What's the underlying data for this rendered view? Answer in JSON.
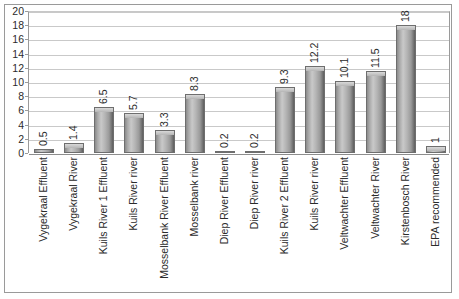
{
  "chart_data": {
    "type": "bar",
    "title": "",
    "subtitle": "",
    "xlabel": "",
    "ylabel": "",
    "ylim": [
      0,
      20
    ],
    "ytick_step": 2,
    "yticks": [
      20,
      18,
      16,
      14,
      12,
      10,
      8,
      6,
      4,
      2,
      0
    ],
    "grid": true,
    "legend": "none",
    "orientation": "vertical",
    "categories": [
      "Vygekraal Effluent",
      "Vygekraal River",
      "Kuils River 1 Effluent",
      "Kuils River river",
      "Mosselbank River Effluent",
      "Mosselbank river",
      "Diep River Effluent",
      "Diep River river",
      "Kuils River 2 Effluent",
      "Kuils River river",
      "Veltwachter Effluent",
      "Veltwachter River",
      "Kirstenbosch River",
      "EPA recommended"
    ],
    "values": [
      0.5,
      1.4,
      6.5,
      5.7,
      3.3,
      8.3,
      0.2,
      0.2,
      9.3,
      12.2,
      10.1,
      11.5,
      18,
      1
    ],
    "value_labels": [
      "0.5",
      "1.4",
      "6.5",
      "5.7",
      "3.3",
      "8.3",
      "0.2",
      "0.2",
      "9.3",
      "12.2",
      "10.1",
      "11.5",
      "18",
      "1"
    ],
    "bar_fill_color": "#a8a8a8",
    "bar_edge_color": "#6e6e6e",
    "gridline_color": "#c9c9c9",
    "axis_color": "#9a9a9a",
    "text_color": "#2b2b2b",
    "background_color": "#ffffff"
  }
}
